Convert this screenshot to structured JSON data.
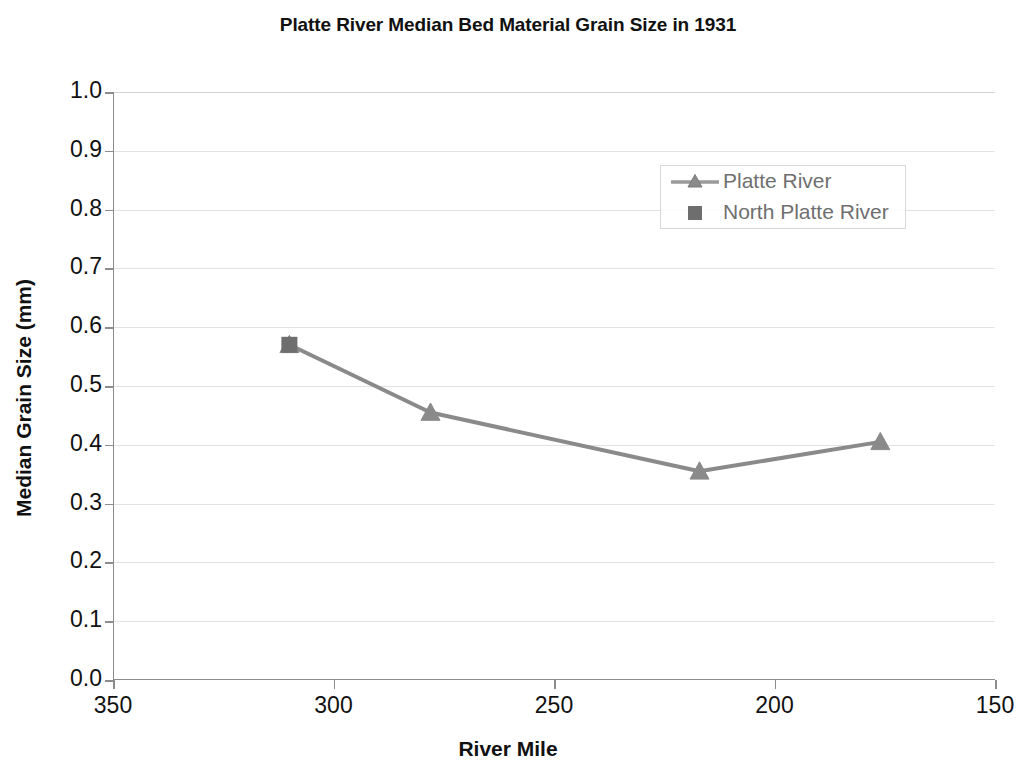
{
  "chart_data": {
    "type": "line",
    "title": "Platte River Median Bed Material Grain Size in 1931",
    "xlabel": "River Mile",
    "ylabel": "Median Grain Size (mm)",
    "xlim": [
      350,
      150
    ],
    "ylim": [
      0.0,
      1.0
    ],
    "x_reversed": true,
    "grid": true,
    "legend_position": "upper right",
    "x_ticks": [
      "350",
      "300",
      "250",
      "200",
      "150"
    ],
    "x_tick_values": [
      350,
      300,
      250,
      200,
      150
    ],
    "y_ticks": [
      "0.0",
      "0.1",
      "0.2",
      "0.3",
      "0.4",
      "0.5",
      "0.6",
      "0.7",
      "0.8",
      "0.9",
      "1.0"
    ],
    "y_tick_values": [
      0.0,
      0.1,
      0.2,
      0.3,
      0.4,
      0.5,
      0.6,
      0.7,
      0.8,
      0.9,
      1.0
    ],
    "series": [
      {
        "name": "Platte River",
        "marker": "triangle",
        "color": "#8a8a8a",
        "line": true,
        "x": [
          310,
          278,
          217,
          176
        ],
        "values": [
          0.57,
          0.455,
          0.355,
          0.405
        ]
      },
      {
        "name": "North Platte River",
        "marker": "square",
        "color": "#6e6e6e",
        "line": false,
        "x": [
          310
        ],
        "values": [
          0.57
        ]
      }
    ],
    "legend": [
      "Platte River",
      "North Platte River"
    ]
  },
  "colors": {
    "line": "#8a8a8a",
    "square_marker": "#6e6e6e",
    "axis": "#8c8c8c",
    "grid": "#e2e2e2",
    "text": "#111111",
    "legend_text": "#6f6f6f",
    "background": "#ffffff"
  }
}
